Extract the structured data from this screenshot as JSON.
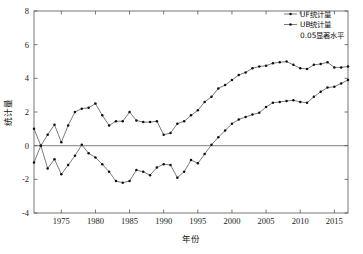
{
  "chart_data": {
    "type": "line",
    "title": "",
    "xlabel": "年份",
    "ylabel": "统计量",
    "xlim": [
      1971,
      2017
    ],
    "ylim": [
      -4,
      8
    ],
    "xticks": [
      1975,
      1980,
      1985,
      1990,
      1995,
      2000,
      2005,
      2010,
      2015
    ],
    "yticks": [
      -4,
      -2,
      0,
      2,
      4,
      6,
      8
    ],
    "grid": false,
    "legend_position": "top-right",
    "legend": [
      "UF统计量",
      "UB统计量",
      "0.05显著水平"
    ],
    "annotations": [
      "0.05显著水平"
    ],
    "reference_lines": [
      {
        "axis": "y",
        "value": 0,
        "color": "#999999"
      }
    ],
    "x": [
      1971,
      1972,
      1973,
      1974,
      1975,
      1976,
      1977,
      1978,
      1979,
      1980,
      1981,
      1982,
      1983,
      1984,
      1985,
      1986,
      1987,
      1988,
      1989,
      1990,
      1991,
      1992,
      1993,
      1994,
      1995,
      1996,
      1997,
      1998,
      1999,
      2000,
      2001,
      2002,
      2003,
      2004,
      2005,
      2006,
      2007,
      2008,
      2009,
      2010,
      2011,
      2012,
      2013,
      2014,
      2015,
      2016,
      2017
    ],
    "series": [
      {
        "name": "UF统计量",
        "color": "#333333",
        "marker": "dot",
        "values": [
          1.0,
          0.0,
          0.65,
          1.25,
          0.2,
          1.2,
          2.0,
          2.2,
          2.25,
          2.5,
          1.8,
          1.2,
          1.45,
          1.45,
          2.0,
          1.5,
          1.4,
          1.4,
          1.45,
          0.65,
          0.75,
          1.3,
          1.45,
          1.8,
          2.1,
          2.6,
          2.9,
          3.4,
          3.6,
          3.9,
          4.2,
          4.35,
          4.6,
          4.7,
          4.75,
          4.9,
          4.95,
          5.0,
          4.8,
          4.6,
          4.55,
          4.8,
          4.85,
          4.95,
          4.65,
          4.65,
          4.7
        ]
      },
      {
        "name": "UB统计量",
        "color": "#333333",
        "marker": "dot",
        "values": [
          -1.0,
          0.0,
          -1.35,
          -0.8,
          -1.7,
          -1.15,
          -0.6,
          0.05,
          -0.45,
          -0.7,
          -1.1,
          -1.55,
          -2.1,
          -2.2,
          -2.1,
          -1.45,
          -1.55,
          -1.75,
          -1.3,
          -1.1,
          -1.15,
          -1.9,
          -1.55,
          -0.85,
          -1.05,
          -0.5,
          0.05,
          0.5,
          0.9,
          1.3,
          1.55,
          1.7,
          1.85,
          1.95,
          2.3,
          2.55,
          2.6,
          2.65,
          2.7,
          2.6,
          2.55,
          2.9,
          3.2,
          3.45,
          3.5,
          3.7,
          3.9
        ]
      }
    ]
  }
}
